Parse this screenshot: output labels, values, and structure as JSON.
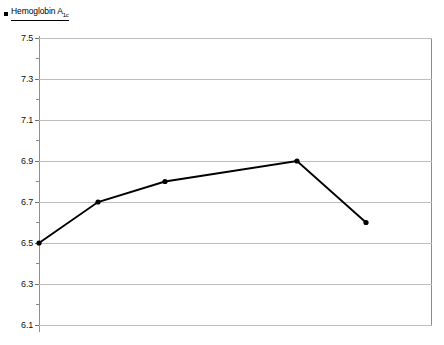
{
  "legend": {
    "marker_color": "#000000",
    "label_main": "Hemoglobin A",
    "label_sub": "1c",
    "icon": "square-marker"
  },
  "axis": {
    "y_ticks": [
      "7.5",
      "7.3",
      "7.1",
      "6.9",
      "6.7",
      "6.5",
      "6.3",
      "6.1"
    ]
  },
  "chart_data": {
    "type": "line",
    "title": "",
    "xlabel": "",
    "ylabel": "",
    "series": [
      {
        "name": "Hemoglobin A1c",
        "color": "#000000",
        "marker": "circle",
        "values": [
          6.5,
          6.7,
          6.8,
          6.9,
          6.6
        ]
      }
    ],
    "x": [
      0,
      0.45,
      0.96,
      2.0,
      2.5
    ],
    "categories": [
      "",
      "",
      "",
      "",
      ""
    ],
    "ylim": [
      6.1,
      7.5
    ],
    "yticks": [
      6.1,
      6.3,
      6.5,
      6.7,
      6.9,
      7.1,
      7.3,
      7.5
    ],
    "minor_yticks": [
      6.2,
      6.4,
      6.6,
      6.8,
      7.0,
      7.2,
      7.4
    ],
    "grid": true,
    "grid_color": "#bdbdbd",
    "legend_position": "top-left",
    "point_pixel_x": [
      0,
      59,
      126,
      258,
      327
    ]
  }
}
